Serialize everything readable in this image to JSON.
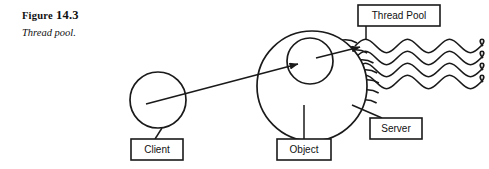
{
  "figure": {
    "number_prefix": "Figure",
    "number": "14.3",
    "title": "Thread pool."
  },
  "diagram": {
    "type": "thread-pool-illustration",
    "stroke_color": "#1a1a1a",
    "fill_color": "#ffffff",
    "nodes": [
      {
        "id": "client",
        "label": "Client",
        "shape": "circle",
        "cx": 158,
        "cy": 100,
        "r": 28
      },
      {
        "id": "server",
        "label": "Server",
        "shape": "circle",
        "cx": 312,
        "cy": 86,
        "r": 55
      },
      {
        "id": "object",
        "label": "Object",
        "shape": "circle",
        "cx": 310,
        "cy": 61,
        "r": 23
      }
    ],
    "label_boxes": [
      {
        "id": "thread-pool-box",
        "label": "Thread Pool",
        "x": 358,
        "y": 5,
        "w": 82,
        "h": 21
      },
      {
        "id": "client-box",
        "label": "Client",
        "x": 131,
        "y": 139,
        "w": 52,
        "h": 21
      },
      {
        "id": "object-box",
        "label": "Object",
        "x": 277,
        "y": 139,
        "w": 54,
        "h": 21
      },
      {
        "id": "server-box",
        "label": "Server",
        "x": 370,
        "y": 118,
        "w": 52,
        "h": 21
      }
    ],
    "threads": {
      "count": 4,
      "wave_start_x": 355,
      "wave_end_x": 483,
      "baselines": [
        46,
        58,
        70,
        82
      ],
      "amplitude": 9,
      "wavelength": 42
    },
    "arrows": [
      {
        "id": "request-arrow",
        "from": "client",
        "to": "object",
        "x1": 146,
        "y1": 104,
        "x2": 298,
        "y2": 64
      },
      {
        "id": "dispatch-arrow",
        "from": "object",
        "to": "thread-pool",
        "x1": 316,
        "y1": 58,
        "x2": 360,
        "y2": 47
      }
    ],
    "leaders": [
      {
        "id": "client-leader",
        "x1": 162,
        "y1": 128,
        "x2": 155,
        "y2": 139
      },
      {
        "id": "object-leader",
        "x1": 304,
        "y1": 105,
        "x2": 304,
        "y2": 139
      },
      {
        "id": "server-leader",
        "x1": 352,
        "y1": 105,
        "x2": 382,
        "y2": 118
      },
      {
        "id": "thread-pool-leader",
        "x1": 366,
        "y1": 26,
        "x2": 366,
        "y2": 40
      }
    ]
  }
}
